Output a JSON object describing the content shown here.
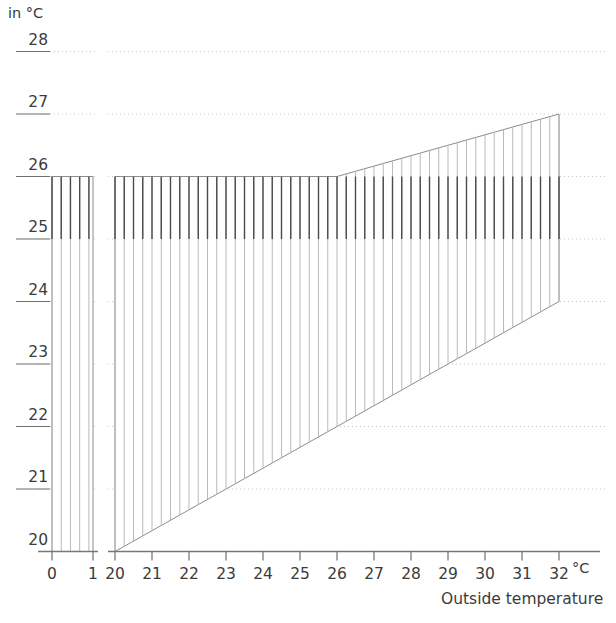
{
  "chart_data": {
    "type": "area",
    "title": "",
    "subtitle": "",
    "xlabel": "Outside temperature",
    "ylabel": "in °C",
    "x_unit": "°C",
    "y_unit": "in °C",
    "grid": true,
    "legend": null,
    "axis_break": true,
    "ylim": [
      20,
      28
    ],
    "y_ticks": [
      20,
      21,
      22,
      23,
      24,
      25,
      26,
      27,
      28
    ],
    "y_tick_labels": [
      "20",
      "21",
      "22",
      "23",
      "24",
      "25",
      "26",
      "27",
      "28"
    ],
    "x_segments": [
      {
        "name": "left-segment",
        "xlim": [
          -0.35,
          1.35
        ],
        "ticks": [
          0,
          1
        ],
        "tick_labels": [
          "0",
          "1"
        ]
      },
      {
        "name": "right-segment",
        "xlim": [
          20,
          32.6
        ],
        "ticks": [
          20,
          21,
          22,
          23,
          24,
          25,
          26,
          27,
          28,
          29,
          30,
          31,
          32
        ],
        "tick_labels": [
          "20",
          "21",
          "22",
          "23",
          "24",
          "25",
          "26",
          "27",
          "28",
          "29",
          "30",
          "31",
          "32"
        ]
      }
    ],
    "series": [
      {
        "name": "comfort-band-left",
        "segment": "left-segment",
        "upper": [
          {
            "x": 0,
            "y": 26
          },
          {
            "x": 1,
            "y": 26
          }
        ],
        "lower": [
          {
            "x": 0,
            "y": 20
          },
          {
            "x": 1,
            "y": 20
          }
        ],
        "hatched": true
      },
      {
        "name": "comfort-band-right",
        "segment": "right-segment",
        "upper": [
          {
            "x": 20,
            "y": 26
          },
          {
            "x": 26,
            "y": 26
          },
          {
            "x": 32,
            "y": 27
          }
        ],
        "lower": [
          {
            "x": 20,
            "y": 20
          },
          {
            "x": 32,
            "y": 24
          }
        ],
        "hatched": true
      }
    ],
    "annotations": [
      {
        "text": "in °C",
        "position": "top-left"
      },
      {
        "text": "°C",
        "position": "x-axis-end"
      },
      {
        "text": "Outside temperature",
        "position": "below-x-axis-right"
      }
    ],
    "colors": {
      "hatch_dark": "#4a4a4a",
      "hatch_light": "#b9b9b9",
      "outline": "#8c8c8c",
      "gridline": "#c9c9c9",
      "axis": "#777777",
      "text": "#3b3b3b"
    }
  },
  "labels": {
    "y_axis_unit": "in °C",
    "x_axis_unit": "°C",
    "x_axis_title": "Outside temperature"
  }
}
